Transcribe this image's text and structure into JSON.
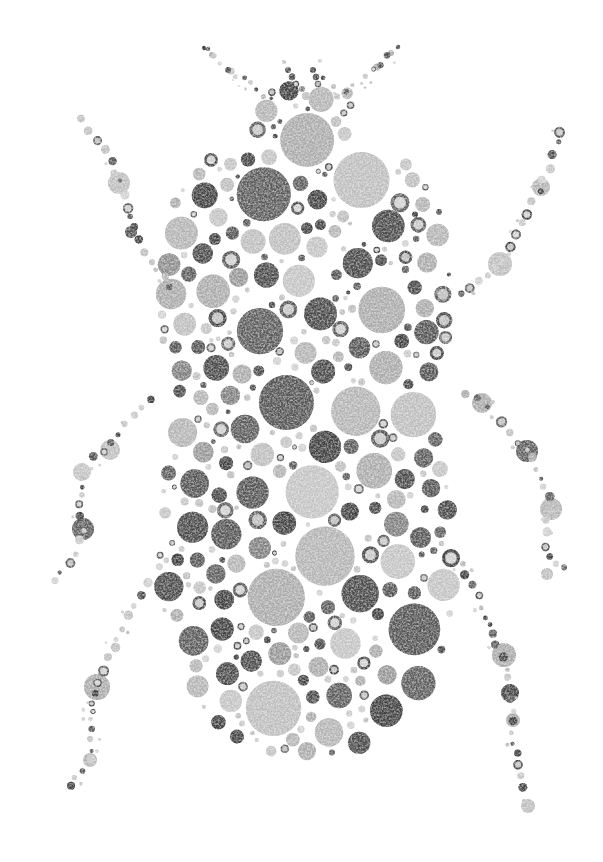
{
  "illustration": {
    "alt": "Stippled pointillism drawing of a beetle composed of many textured gray dots on a white background",
    "canvas": {
      "width": 603,
      "height": 862,
      "background": "#ffffff"
    },
    "seed": 11,
    "palette": {
      "background": "#ffffff",
      "darks": [
        "#474747",
        "#525252",
        "#3f3f3f",
        "#5a5a5a"
      ],
      "mids": [
        "#8a8a8a",
        "#949494",
        "#7d7d7d"
      ],
      "lights": [
        "#b2b2b2",
        "#bcbcbc",
        "#a9a9a9",
        "#c2c2c2"
      ],
      "pales": [
        "#c6c6c6",
        "#cfcfcf",
        "#bdbdbd"
      ]
    },
    "silhouette": [
      {
        "name": "head",
        "cx": 304,
        "cy": 120,
        "rx": 57,
        "ry": 47,
        "n": 2.2
      },
      {
        "name": "thorax",
        "cx": 305,
        "cy": 295,
        "rx": 146,
        "ry": 158,
        "n": 2.8
      },
      {
        "name": "abdomen",
        "cx": 307,
        "cy": 545,
        "rx": 150,
        "ry": 215,
        "n": 2.3
      }
    ],
    "sample_box": {
      "x0": 140,
      "y0": 68,
      "x1": 465,
      "y1": 765
    },
    "dot_classes": [
      {
        "rmin": 22,
        "rmax": 31,
        "count": 13,
        "gap": 3,
        "tones": {
          "light": 0.72,
          "dark": 0.28
        }
      },
      {
        "rmin": 14,
        "rmax": 20,
        "count": 26,
        "gap": 3,
        "tones": {
          "dark": 0.55,
          "light": 0.45
        }
      },
      {
        "rmin": 9,
        "rmax": 13,
        "count": 52,
        "gap": 2.5,
        "tones": {
          "dark": 0.5,
          "light": 0.32,
          "mid": 0.18
        }
      },
      {
        "rmin": 5,
        "rmax": 8,
        "count": 95,
        "gap": 2,
        "tones": {
          "dark": 0.42,
          "light": 0.28,
          "ring": 0.3
        }
      },
      {
        "rmin": 2,
        "rmax": 4.2,
        "count": 175,
        "gap": 1.6,
        "tones": {
          "pale": 0.58,
          "dark": 0.24,
          "ring": 0.18
        }
      }
    ],
    "chain_tones": {
      "dark": 0.38,
      "pale": 0.34,
      "ring": 0.18,
      "light": 0.1
    },
    "appendages": [
      {
        "name": "antenna-left",
        "scale": 0.72,
        "points": [
          [
            272,
            101
          ],
          [
            258,
            90
          ],
          [
            244,
            80
          ],
          [
            230,
            70
          ],
          [
            218,
            60
          ],
          [
            207,
            50
          ]
        ],
        "joints": [
          [
            231,
            71,
            5,
            "light"
          ],
          [
            212,
            55,
            4,
            "light"
          ],
          [
            204,
            48,
            3,
            "dark"
          ]
        ]
      },
      {
        "name": "antenna-right",
        "scale": 0.72,
        "points": [
          [
            338,
            99
          ],
          [
            352,
            88
          ],
          [
            366,
            77
          ],
          [
            379,
            66
          ],
          [
            390,
            55
          ],
          [
            397,
            48
          ]
        ],
        "joints": [
          [
            377,
            67,
            5,
            "light"
          ],
          [
            391,
            53,
            4,
            "light"
          ],
          [
            398,
            47,
            3,
            "dark"
          ]
        ]
      },
      {
        "name": "front-leg-left",
        "scale": 1,
        "points": [
          [
            172,
            287
          ],
          [
            152,
            262
          ],
          [
            139,
            240
          ],
          [
            128,
            214
          ],
          [
            120,
            186
          ],
          [
            110,
            158
          ],
          [
            97,
            140
          ],
          [
            85,
            125
          ],
          [
            80,
            118
          ]
        ],
        "joints": [
          [
            119,
            183,
            11,
            "light"
          ],
          [
            131,
            232,
            6,
            "dark"
          ]
        ]
      },
      {
        "name": "front-leg-right",
        "scale": 1,
        "points": [
          [
            462,
            295
          ],
          [
            487,
            277
          ],
          [
            500,
            264
          ],
          [
            512,
            247
          ],
          [
            521,
            230
          ],
          [
            531,
            207
          ],
          [
            540,
            188
          ],
          [
            549,
            168
          ],
          [
            556,
            150
          ],
          [
            560,
            132
          ]
        ],
        "joints": [
          [
            500,
            264,
            12,
            "light"
          ],
          [
            541,
            187,
            9,
            "light"
          ]
        ]
      },
      {
        "name": "middle-leg-left",
        "scale": 1,
        "points": [
          [
            152,
            398
          ],
          [
            132,
            418
          ],
          [
            110,
            447
          ],
          [
            85,
            465
          ],
          [
            79,
            500
          ],
          [
            83,
            529
          ],
          [
            76,
            553
          ],
          [
            62,
            571
          ],
          [
            48,
            584
          ]
        ],
        "joints": [
          [
            110,
            450,
            10,
            "light"
          ],
          [
            82,
            472,
            9,
            "light"
          ],
          [
            83,
            529,
            11,
            "dark"
          ]
        ]
      },
      {
        "name": "middle-leg-right",
        "scale": 1,
        "points": [
          [
            466,
            393
          ],
          [
            483,
            404
          ],
          [
            497,
            420
          ],
          [
            514,
            436
          ],
          [
            527,
            452
          ],
          [
            538,
            470
          ],
          [
            547,
            490
          ],
          [
            551,
            510
          ],
          [
            545,
            533
          ],
          [
            548,
            557
          ],
          [
            556,
            566
          ],
          [
            565,
            567
          ]
        ],
        "joints": [
          [
            482,
            403,
            10,
            "light"
          ],
          [
            527,
            451,
            11,
            "dark"
          ],
          [
            551,
            509,
            11,
            "light"
          ],
          [
            547,
            574,
            6,
            "light"
          ]
        ]
      },
      {
        "name": "hind-leg-left",
        "scale": 1,
        "points": [
          [
            150,
            583
          ],
          [
            134,
            608
          ],
          [
            121,
            632
          ],
          [
            108,
            658
          ],
          [
            97,
            686
          ],
          [
            92,
            712
          ],
          [
            91,
            738
          ],
          [
            90,
            760
          ],
          [
            79,
            775
          ],
          [
            68,
            787
          ]
        ],
        "joints": [
          [
            97,
            687,
            13,
            "light"
          ],
          [
            90,
            760,
            7,
            "light"
          ]
        ]
      },
      {
        "name": "hind-leg-right",
        "scale": 1,
        "points": [
          [
            460,
            563
          ],
          [
            471,
            580
          ],
          [
            478,
            595
          ],
          [
            485,
            615
          ],
          [
            492,
            633
          ],
          [
            500,
            650
          ],
          [
            506,
            668
          ],
          [
            509,
            690
          ],
          [
            512,
            712
          ],
          [
            511,
            733
          ],
          [
            515,
            752
          ],
          [
            518,
            772
          ],
          [
            521,
            790
          ],
          [
            526,
            806
          ]
        ],
        "joints": [
          [
            504,
            655,
            12,
            "light"
          ],
          [
            510,
            693,
            9,
            "dark"
          ],
          [
            513,
            720,
            7,
            "light"
          ],
          [
            528,
            806,
            7,
            "light"
          ]
        ]
      }
    ],
    "mouthparts": [
      [
        288,
        70,
        3,
        "dark"
      ],
      [
        292,
        77,
        3.2,
        "dark"
      ],
      [
        296,
        84,
        2.6,
        "ring"
      ],
      [
        313,
        70,
        3,
        "dark"
      ],
      [
        316,
        77,
        3.2,
        "dark"
      ],
      [
        318,
        84,
        2.6,
        "ring"
      ],
      [
        284,
        62,
        2,
        "pale"
      ],
      [
        320,
        61,
        2,
        "pale"
      ],
      [
        302,
        89,
        3,
        "mid"
      ],
      [
        306,
        96,
        4,
        "light"
      ]
    ]
  }
}
